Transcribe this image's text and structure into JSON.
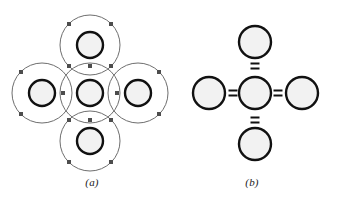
{
  "figure": {
    "background_color": "#ffffff",
    "width": 339,
    "height": 199
  },
  "panels": [
    {
      "id": "a",
      "caption": "(a)",
      "description": "Bohr-style overlapping electron shell representation",
      "shell_color": "#6e6e6e",
      "nucleus_stroke_color": "#111111",
      "nucleus_fill_color": "#f2f2f2",
      "electron_dot_color": "#4d4d4d",
      "atoms": [
        {
          "name": "center-atom",
          "cx": 90,
          "cy": 93,
          "nucleus_r": 13,
          "shell_r": 30
        },
        {
          "name": "top-atom",
          "cx": 90,
          "cy": 45,
          "nucleus_r": 13,
          "shell_r": 30
        },
        {
          "name": "bottom-atom",
          "cx": 90,
          "cy": 141,
          "nucleus_r": 13,
          "shell_r": 30
        },
        {
          "name": "left-atom",
          "cx": 42,
          "cy": 93,
          "nucleus_r": 13,
          "shell_r": 30
        },
        {
          "name": "right-atom",
          "cx": 138,
          "cy": 93,
          "nucleus_r": 13,
          "shell_r": 30
        }
      ],
      "electron_dots": [
        {
          "x": 69,
          "y": 24
        },
        {
          "x": 111,
          "y": 24
        },
        {
          "x": 69,
          "y": 162
        },
        {
          "x": 111,
          "y": 162
        },
        {
          "x": 21,
          "y": 72
        },
        {
          "x": 21,
          "y": 114
        },
        {
          "x": 159,
          "y": 72
        },
        {
          "x": 159,
          "y": 114
        },
        {
          "x": 69,
          "y": 66
        },
        {
          "x": 111,
          "y": 66
        },
        {
          "x": 69,
          "y": 120
        },
        {
          "x": 111,
          "y": 120
        },
        {
          "x": 63,
          "y": 93
        },
        {
          "x": 117,
          "y": 93
        },
        {
          "x": 90,
          "y": 66
        },
        {
          "x": 90,
          "y": 120
        }
      ],
      "dot_size": 4
    },
    {
      "id": "b",
      "caption": "(b)",
      "description": "Simplified structural formula with four double bonds",
      "circle_stroke_color": "#111111",
      "circle_fill_color": "#f2f2f2",
      "bond_color": "#111111",
      "atoms": [
        {
          "name": "center-atom",
          "cx": 255,
          "cy": 93,
          "r": 16
        },
        {
          "name": "top-atom",
          "cx": 255,
          "cy": 42,
          "r": 16
        },
        {
          "name": "bottom-atom",
          "cx": 255,
          "cy": 144,
          "r": 16
        },
        {
          "name": "left-atom",
          "cx": 209,
          "cy": 93,
          "r": 16
        },
        {
          "name": "right-atom",
          "cx": 302,
          "cy": 93,
          "r": 16
        }
      ],
      "bonds": [
        {
          "name": "bond-top",
          "orientation": "vertical",
          "symbol": "=",
          "cx": 255,
          "cy": 66
        },
        {
          "name": "bond-bottom",
          "orientation": "vertical",
          "symbol": "=",
          "cx": 255,
          "cy": 120
        },
        {
          "name": "bond-left",
          "orientation": "horizontal",
          "symbol": "=",
          "cx": 233,
          "cy": 93
        },
        {
          "name": "bond-right",
          "orientation": "horizontal",
          "symbol": "=",
          "cx": 278,
          "cy": 93
        }
      ],
      "bond_stroke_width": 2,
      "bond_arm_length": 9,
      "bond_gap": 5
    }
  ]
}
